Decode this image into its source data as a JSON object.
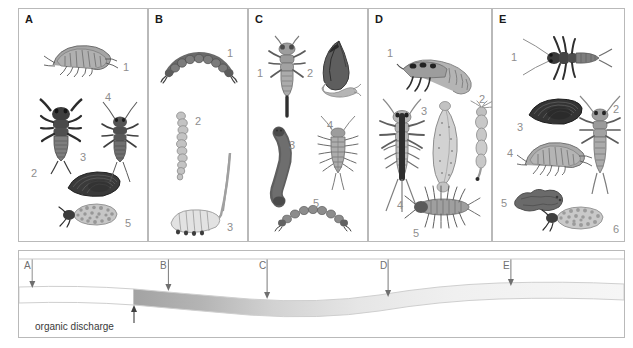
{
  "figure": {
    "type": "river-organic-pollution-indicator-species-diagram",
    "panel_count": 5,
    "discharge_label": "organic discharge"
  },
  "panels": [
    {
      "letter": "A",
      "zone": "clean water upstream",
      "organisms": [
        {
          "num": "1",
          "name": "freshwater-shrimp-amphipod"
        },
        {
          "num": "2",
          "name": "stonefly-nymph"
        },
        {
          "num": "3",
          "name": "freshwater-mussel"
        },
        {
          "num": "4",
          "name": "mayfly-nymph"
        },
        {
          "num": "5",
          "name": "caddisfly-larva-in-case"
        }
      ]
    },
    {
      "letter": "B",
      "zone": "heavily polluted",
      "organisms": [
        {
          "num": "1",
          "name": "bloodworm-chironomid-larva"
        },
        {
          "num": "2",
          "name": "tubifex-sludge-worm"
        },
        {
          "num": "3",
          "name": "rat-tailed-maggot"
        }
      ]
    },
    {
      "letter": "C",
      "zone": "recovering-early",
      "organisms": [
        {
          "num": "1",
          "name": "damselfly-nymph"
        },
        {
          "num": "2",
          "name": "pond-snail"
        },
        {
          "num": "3",
          "name": "leech"
        },
        {
          "num": "4",
          "name": "water-louse-asellus"
        },
        {
          "num": "5",
          "name": "bloodworm-chironomid-larva"
        }
      ]
    },
    {
      "letter": "D",
      "zone": "recovering-mid",
      "organisms": [
        {
          "num": "1",
          "name": "caddisfly-larva"
        },
        {
          "num": "2",
          "name": "mosquito-larva"
        },
        {
          "num": "3",
          "name": "leech"
        },
        {
          "num": "4",
          "name": "mayfly-nymph"
        },
        {
          "num": "5",
          "name": "water-louse-asellus"
        }
      ]
    },
    {
      "letter": "E",
      "zone": "recovered clean water",
      "organisms": [
        {
          "num": "1",
          "name": "mayfly-nymph"
        },
        {
          "num": "2",
          "name": "stonefly-nymph"
        },
        {
          "num": "3",
          "name": "freshwater-mussel"
        },
        {
          "num": "4",
          "name": "freshwater-shrimp-amphipod"
        },
        {
          "num": "5",
          "name": "flatworm"
        },
        {
          "num": "6",
          "name": "caddisfly-larva-in-case"
        }
      ]
    }
  ],
  "gradient": {
    "markers": [
      {
        "label": "A",
        "x_pct": 2.2
      },
      {
        "label": "B",
        "x_pct": 24.7
      },
      {
        "label": "C",
        "x_pct": 41.0
      },
      {
        "label": "D",
        "x_pct": 61.0
      },
      {
        "label": "E",
        "x_pct": 81.3
      }
    ],
    "discharge_label": "organic discharge",
    "flow_direction": "left-to-right",
    "plume_start_pct": 19.0
  },
  "colors": {
    "border": "#b9b9b9",
    "panel_letter": "#1a1a1a",
    "number": "#8e8e8e",
    "organism_mid": "#9a9a9a",
    "organism_dark": "#4a4a4a",
    "plume_dark": "#a3a3a3",
    "plume_light": "#f2f2f2",
    "river_outline": "#cfcfcf"
  }
}
